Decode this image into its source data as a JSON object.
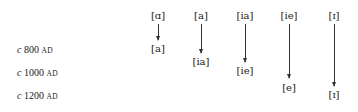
{
  "dates": [
    {
      "prefix": "c",
      "year": "800",
      "era": "AD"
    },
    {
      "prefix": "c",
      "year": "1000",
      "era": "AD"
    },
    {
      "prefix": "c",
      "year": "1200",
      "era": "AD"
    }
  ],
  "columns": [
    {
      "from": "[ɑ]",
      "to": "[a]"
    },
    {
      "from": "[a]",
      "to": "[ia]"
    },
    {
      "from": "[ia]",
      "to": "[ie]"
    },
    {
      "from": "[ie]",
      "to": "[e]"
    },
    {
      "from": "[ɪ]",
      "to": "[ɪ]"
    }
  ]
}
